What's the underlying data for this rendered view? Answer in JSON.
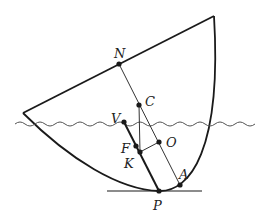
{
  "diagram": {
    "labels": {
      "N": "N",
      "C": "C",
      "V": "V",
      "O": "O",
      "F": "F",
      "K": "K",
      "A": "A",
      "P": "P"
    },
    "colors": {
      "stroke": "#1a1a1a",
      "water": "#555555",
      "background": "#ffffff"
    }
  }
}
